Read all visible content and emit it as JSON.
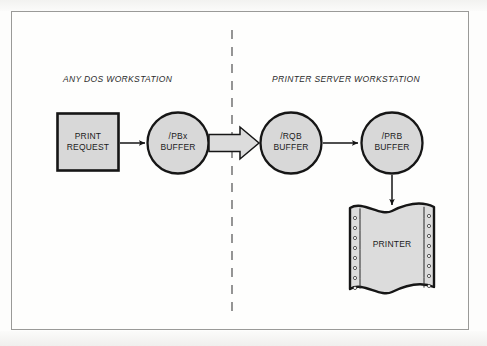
{
  "diagram": {
    "sections": [
      {
        "id": "dos",
        "label": "ANY DOS WORKSTATION"
      },
      {
        "id": "server",
        "label": "PRINTER SERVER WORKSTATION"
      }
    ],
    "nodes": [
      {
        "id": "print-request",
        "shape": "rectangle",
        "line1": "PRINT",
        "line2": "REQUEST"
      },
      {
        "id": "pbx-buffer",
        "shape": "circle",
        "line1": "/PBx",
        "line2": "BUFFER"
      },
      {
        "id": "rqb-buffer",
        "shape": "circle",
        "line1": "/RQB",
        "line2": "BUFFER"
      },
      {
        "id": "prb-buffer",
        "shape": "circle",
        "line1": "/PRB",
        "line2": "BUFFER"
      },
      {
        "id": "printer",
        "shape": "continuous-form-paper",
        "line1": "PRINTER",
        "line2": ""
      }
    ],
    "connectors": [
      {
        "id": "arrow-request-to-pbx",
        "type": "thin-arrow",
        "direction": "right"
      },
      {
        "id": "arrow-pbx-to-rqb",
        "type": "block-arrow",
        "direction": "right"
      },
      {
        "id": "arrow-rqb-to-prb",
        "type": "thin-arrow",
        "direction": "right"
      },
      {
        "id": "arrow-prb-to-printer",
        "type": "thin-arrow",
        "direction": "down"
      }
    ],
    "divider": {
      "id": "workstation-divider",
      "style": "dashed-vertical"
    },
    "colors": {
      "node_fill": "#d8d8d8",
      "node_stroke": "#161616",
      "arrow_fill": "#d8d8d8",
      "divider": "#7b7b7b",
      "frame": "#9a9a98",
      "text": "#1b1b1b",
      "page_background": "#fdfdfc"
    },
    "feed_holes": {
      "left_count": 8,
      "right_count": 8
    }
  }
}
